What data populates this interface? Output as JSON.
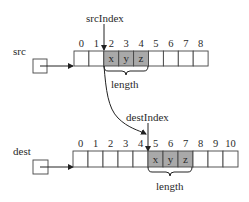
{
  "diagram": {
    "colors": {
      "highlight": "#a9a9a9",
      "stroke": "#444444",
      "text": "#2a2a2a"
    },
    "src": {
      "label": "src",
      "index_label": "srcIndex",
      "length_label": "length",
      "indices": [
        "0",
        "1",
        "2",
        "3",
        "4",
        "5",
        "6",
        "7",
        "8"
      ],
      "cells": [
        "",
        "",
        "x",
        "y",
        "z",
        "",
        "",
        "",
        ""
      ],
      "highlighted": [
        2,
        3,
        4
      ],
      "start_index": 2
    },
    "dest": {
      "label": "dest",
      "index_label": "destIndex",
      "length_label": "length",
      "indices": [
        "0",
        "1",
        "2",
        "3",
        "4",
        "5",
        "6",
        "7",
        "8",
        "9",
        "10"
      ],
      "cells": [
        "",
        "",
        "",
        "",
        "",
        "x",
        "y",
        "z",
        "",
        "",
        ""
      ],
      "highlighted": [
        5,
        6,
        7
      ],
      "start_index": 5
    }
  }
}
